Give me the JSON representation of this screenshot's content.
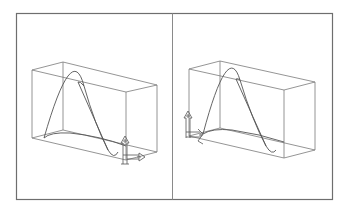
{
  "figure": {
    "panels": [
      {
        "id": "left",
        "label": "View 1",
        "gizmo_position": "bottom-right"
      },
      {
        "id": "right",
        "label": "View 2",
        "gizmo_position": "bottom-left"
      }
    ]
  },
  "colors": {
    "background": "#ffffff",
    "frame": "#6e6e6e",
    "divider": "#8a8a8a",
    "wire": "#7a7a7a",
    "curve": "#555555"
  }
}
